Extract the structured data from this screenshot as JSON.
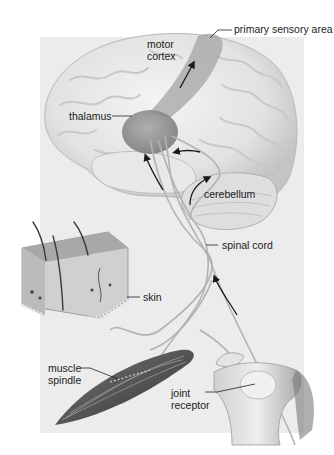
{
  "diagram": {
    "type": "anatomical-illustration",
    "labels": {
      "primary_sensory_area": "primary sensory area",
      "motor_cortex_line1": "motor",
      "motor_cortex_line2": "cortex",
      "thalamus": "thalamus",
      "cerebellum": "cerebellum",
      "spinal_cord": "spinal cord",
      "skin": "skin",
      "muscle_spindle_line1": "muscle",
      "muscle_spindle_line2": "spindle",
      "joint_receptor_line1": "joint",
      "joint_receptor_line2": "receptor"
    },
    "colors": {
      "background": "#ffffff",
      "panel": "#ececec",
      "brain": "#e6e6e6",
      "brain_shadow": "#bdbdbd",
      "highlight_region": "#9a9a9a",
      "nerve": "#b5b5b5",
      "arrow": "#1a1a1a",
      "muscle": "#5a5a5a",
      "skin": "#b0b0b0",
      "bone": "#dcdcdc",
      "text": "#222222"
    }
  }
}
